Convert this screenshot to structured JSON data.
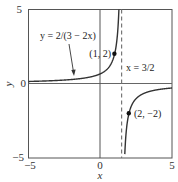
{
  "chart_data": {
    "type": "line",
    "title": "",
    "xlabel": "x",
    "ylabel": "y",
    "xlim": [
      -5,
      5
    ],
    "ylim": [
      -5,
      5
    ],
    "grid": false,
    "x_ticks": [
      "-5",
      "0",
      "5"
    ],
    "y_ticks": [
      "-5",
      "0",
      "5"
    ],
    "series": [
      {
        "name": "y = 2/(3 - 2x)",
        "function": "2/(3-2x)",
        "sample_points": [
          {
            "x": -5,
            "y": 0.154
          },
          {
            "x": -3,
            "y": 0.222
          },
          {
            "x": -1,
            "y": 0.4
          },
          {
            "x": 0,
            "y": 0.667
          },
          {
            "x": 1,
            "y": 2
          },
          {
            "x": 1.3,
            "y": 5
          },
          {
            "x": 1.7,
            "y": -5
          },
          {
            "x": 2,
            "y": -2
          },
          {
            "x": 3,
            "y": -0.667
          },
          {
            "x": 5,
            "y": -0.286
          }
        ]
      }
    ],
    "asymptote": {
      "x": 1.5,
      "label": "x = 3/2",
      "style": "dashed"
    },
    "annotations": [
      {
        "text": "y = 2/(3 − 2x)",
        "type": "curve-label-with-arrow"
      },
      {
        "text": "(1, 2)",
        "x": 1,
        "y": 2
      },
      {
        "text": "(2, −2)",
        "x": 2,
        "y": -2
      },
      {
        "text": "x = 3/2",
        "type": "asymptote-label"
      }
    ],
    "colors": {
      "curve": "#333333",
      "axes": "#555555",
      "frame": "#555555",
      "asymptote": "#777777"
    }
  },
  "labels": {
    "x_tick_min": "−5",
    "x_tick_zero": "0",
    "x_tick_max": "5",
    "y_tick_min": "−5",
    "y_tick_zero": "0",
    "y_tick_max": "5",
    "xlabel": "x",
    "ylabel": "y",
    "curve_label": "y = 2/(3 − 2x)",
    "point1_label": "(1, 2)",
    "point2_label": "(2, −2)",
    "asymptote_label": "x = 3/2"
  }
}
